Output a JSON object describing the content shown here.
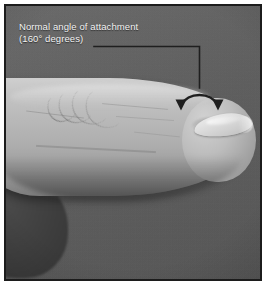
{
  "figure": {
    "kind": "clinical-photograph",
    "alt": "Side view of a finger showing the normal angle between the nail plate and the nail fold"
  },
  "annotation": {
    "label_line_1": "Normal angle of attachment",
    "label_line_2": "(160° degrees)",
    "angle_value": "160",
    "angle_unit": "degrees",
    "text_color": "#f2f2f2",
    "leader_color": "#1f1f1f",
    "marker": {
      "name": "double-headed-curved-arrow",
      "description": "arc spanning the nail-fold junction with arrowheads at both ends"
    }
  },
  "frame": {
    "border_color": "#1c1c1c",
    "background_color": "#606060",
    "page_background": "#ffffff"
  },
  "palette": {
    "backdrop_gray": "#606060",
    "skin_light": "#cfcfcf",
    "skin_mid": "#aeaeae",
    "skin_shadow": "#7c7c7c",
    "nail_highlight": "#ededed",
    "shadow_finger": "#3e3e3e"
  }
}
